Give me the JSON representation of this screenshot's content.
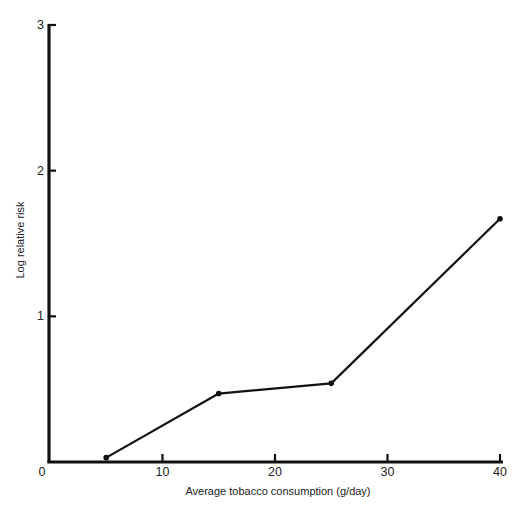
{
  "chart_data": {
    "type": "line",
    "title": "",
    "xlabel": "Average tobacco consumption (g/day)",
    "ylabel": "Log  relative risk",
    "xlim": [
      0,
      40
    ],
    "ylim": [
      0,
      3
    ],
    "x_ticks": [
      0,
      10,
      20,
      30,
      40
    ],
    "y_ticks": [
      1,
      2,
      3
    ],
    "grid": false,
    "legend": null,
    "series": [
      {
        "name": "Log relative risk",
        "x": [
          5,
          15,
          25,
          40
        ],
        "values": [
          0.03,
          0.47,
          0.54,
          1.67
        ],
        "marker": "filled-circle",
        "color": "#111111"
      }
    ]
  },
  "axes": {
    "origin_label": "0",
    "x_tick_labels": [
      "10",
      "20",
      "30",
      "40"
    ],
    "y_tick_labels": [
      "1",
      "2",
      "3"
    ],
    "x_title": "Average tobacco consumption (g/day)",
    "y_title": "Log  relative risk"
  },
  "colors": {
    "ink": "#111111",
    "background": "#ffffff"
  }
}
